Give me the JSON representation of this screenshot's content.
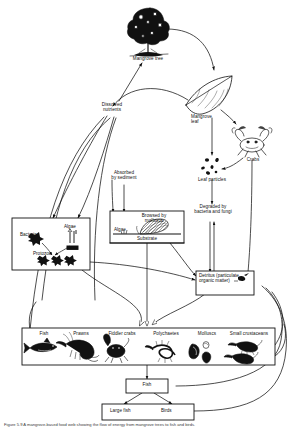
{
  "figure": {
    "domain": "Diagram",
    "kind": "mangrove-ecosystem-food-web",
    "caption": "Figure 5.9   A mangrove-based food web showing the flow of energy from mangrove trees to fish and birds."
  },
  "nodes": {
    "mangrove_tree": {
      "label": "Mangrove tree",
      "icon": "tree-icon"
    },
    "mangrove_leaf": {
      "label": "Mangrove\nleaf",
      "icon": "leaf-icon"
    },
    "dissolved_nutrients": {
      "label": "Dissolved\nnutrients"
    },
    "absorbed_by_sediment": {
      "label": "Absorbed\nby sediment"
    },
    "leaf_particles": {
      "label": "Leaf particles",
      "icon": "particles-icon"
    },
    "crabs": {
      "label": "Crabs",
      "icon": "crab-icon"
    },
    "degraded": {
      "label": "Degraded by\nbacteria and fungi"
    },
    "detritus": {
      "label": "Detritus\n(particulate\norganic matter)",
      "icon": "detritus-icon"
    },
    "microbes_box": {
      "bacteria": "Bacteria",
      "algae": "Algae",
      "protozoa": "Protozoa"
    },
    "substrate_box": {
      "browsed_by": "Browsed by\nmolluscs",
      "algae": "Algae",
      "substrate": "Substrate"
    },
    "fish": {
      "label": "Fish"
    },
    "large_fish": {
      "label": "Large fish"
    },
    "birds": {
      "label": "Birds"
    }
  },
  "consumer_row": {
    "items": [
      {
        "label": "Fish",
        "icon": "fish-icon"
      },
      {
        "label": "Prawns",
        "icon": "prawn-icon"
      },
      {
        "label": "Fiddler crabs",
        "icon": "fiddler-crab-icon"
      },
      {
        "label": "Polychaetes",
        "icon": "polychaete-icon"
      },
      {
        "label": "Molluscs",
        "icon": "mollusc-icon"
      },
      {
        "label": "Small crustaceans",
        "icon": "crustacean-icon"
      }
    ]
  },
  "colors": {
    "ink": "#111111",
    "line": "#222222",
    "paper": "#ffffff",
    "caption": "#3a3a3a"
  }
}
